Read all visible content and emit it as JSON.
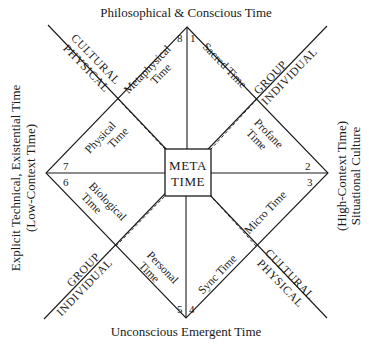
{
  "diagram": {
    "center": {
      "line1": "META",
      "line2": "TIME"
    },
    "axes": {
      "top": "Philosophical & Conscious Time",
      "bottom": "Unconscious Emergent Time",
      "left_line1": "Explicit Technical, Existential Time",
      "left_line2": "(Low-Context Time)",
      "right_line1": "(High-Context Time)",
      "right_line2": "Situational Culture"
    },
    "dimensions": {
      "top_left_outer": "CULTURAL",
      "top_left_inner": "PHYSICAL",
      "top_right_outer": "GROUP",
      "top_right_inner": "INDIVIDUAL",
      "bottom_left_outer": "GROUP",
      "bottom_left_inner": "INDIVIDUAL",
      "bottom_right_outer": "CULTURAL",
      "bottom_right_inner": "PHYSICAL"
    },
    "sectors": [
      {
        "number": "1",
        "label_line1": "Sacred Time",
        "label_line2": ""
      },
      {
        "number": "2",
        "label_line1": "Profane",
        "label_line2": "Time"
      },
      {
        "number": "3",
        "label_line1": "Micro Time",
        "label_line2": ""
      },
      {
        "number": "4",
        "label_line1": "Sync Time",
        "label_line2": ""
      },
      {
        "number": "5",
        "label_line1": "Personal",
        "label_line2": "Time"
      },
      {
        "number": "6",
        "label_line1": "Biological",
        "label_line2": "Time"
      },
      {
        "number": "7",
        "label_line1": "Physical",
        "label_line2": "Time"
      },
      {
        "number": "8",
        "label_line1": "Metaphysical",
        "label_line2": "Time"
      }
    ]
  }
}
